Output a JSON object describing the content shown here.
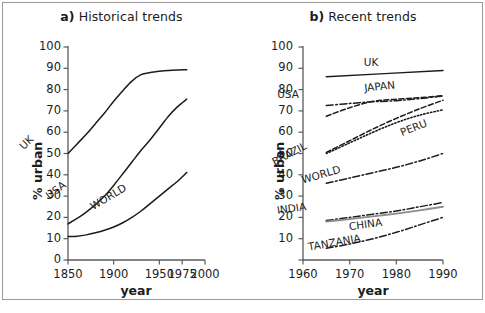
{
  "figure": {
    "width": 485,
    "height": 313,
    "background": "#ffffff",
    "border_color": "#9a9a9a",
    "line_color": "#1c1c1c"
  },
  "panel_a": {
    "title_lead": "a)",
    "title_text": " Historical trends",
    "xlabel": "year",
    "ylabel": "% urban"
  },
  "panel_b": {
    "title_lead": "b)",
    "title_text": " Recent trends",
    "xlabel": "year",
    "ylabel": "% urban"
  },
  "chart_data": [
    {
      "id": "panel_a",
      "type": "line",
      "title": "a) Historical trends",
      "xlabel": "year",
      "ylabel": "% urban",
      "xlim": [
        1850,
        2000
      ],
      "ylim": [
        0,
        100
      ],
      "xticks": [
        1850,
        1900,
        1950,
        1975,
        2000
      ],
      "xtick_labels": [
        "1850",
        "1900",
        "1950",
        "1975",
        "2000"
      ],
      "yticks": [
        0,
        10,
        20,
        30,
        40,
        50,
        60,
        70,
        80,
        90,
        100
      ],
      "ytick_labels": [
        "0",
        "10",
        "20",
        "30",
        "40",
        "50",
        "60",
        "70",
        "80",
        "90",
        "100"
      ],
      "grid": false,
      "legend": "inline-labels",
      "series": [
        {
          "name": "UK",
          "style": "solid",
          "label_rotation": -45,
          "x": [
            1850,
            1860,
            1870,
            1880,
            1890,
            1900,
            1910,
            1920,
            1930,
            1940,
            1950,
            1960,
            1970,
            1980
          ],
          "y": [
            50,
            54.5,
            59,
            64,
            69,
            74.5,
            79.5,
            84,
            87,
            88,
            88.6,
            89,
            89.2,
            89.3
          ]
        },
        {
          "name": "USA",
          "style": "solid",
          "label_rotation": -38,
          "x": [
            1850,
            1860,
            1870,
            1880,
            1890,
            1900,
            1910,
            1920,
            1930,
            1940,
            1950,
            1960,
            1970,
            1980
          ],
          "y": [
            17,
            19.5,
            22.5,
            26,
            30,
            35,
            40.5,
            46,
            51.5,
            56.5,
            62,
            67.5,
            72,
            75.5
          ]
        },
        {
          "name": "WORLD",
          "style": "solid",
          "label_rotation": -32,
          "x": [
            1850,
            1860,
            1870,
            1880,
            1890,
            1900,
            1910,
            1920,
            1930,
            1940,
            1950,
            1960,
            1970,
            1980
          ],
          "y": [
            11,
            11.2,
            11.8,
            12.8,
            14,
            15.5,
            17.5,
            20,
            23,
            26.5,
            30,
            33.5,
            37,
            41
          ]
        }
      ]
    },
    {
      "id": "panel_b",
      "type": "line",
      "title": "b) Recent trends",
      "xlabel": "year",
      "ylabel": "% urban",
      "xlim": [
        1960,
        1990
      ],
      "ylim": [
        0,
        100
      ],
      "xticks": [
        1960,
        1970,
        1980,
        1990
      ],
      "xtick_labels": [
        "1960",
        "1970",
        "1980",
        "1990"
      ],
      "yticks": [
        10,
        20,
        30,
        40,
        50,
        60,
        70,
        80,
        90,
        100
      ],
      "ytick_labels": [
        "10",
        "20",
        "30",
        "40",
        "50",
        "60",
        "70",
        "80",
        "90",
        "100"
      ],
      "grid": false,
      "legend": "inline-labels",
      "series": [
        {
          "name": "UK",
          "style": "solid",
          "label_rotation": 0,
          "x": [
            1965,
            1990
          ],
          "y": [
            86.0,
            89.0
          ]
        },
        {
          "name": "USA",
          "style": "dash-dot",
          "label_rotation": 0,
          "x": [
            1965,
            1970,
            1975,
            1980,
            1985,
            1990
          ],
          "y": [
            72.5,
            73.5,
            74.3,
            74.8,
            75.8,
            77.0
          ]
        },
        {
          "name": "JAPAN",
          "style": "dashed",
          "label_rotation": -6,
          "x": [
            1965,
            1970,
            1975,
            1980,
            1985,
            1990
          ],
          "y": [
            67.5,
            71.5,
            74.5,
            75.5,
            76.2,
            77.2
          ]
        },
        {
          "name": "PERU",
          "style": "dotted",
          "label_rotation": -22,
          "x": [
            1965,
            1970,
            1975,
            1980,
            1985,
            1990
          ],
          "y": [
            50.0,
            55.0,
            60.0,
            64.5,
            68.0,
            70.5
          ]
        },
        {
          "name": "BRAZIL",
          "style": "dashed",
          "label_rotation": -28,
          "x": [
            1965,
            1970,
            1975,
            1980,
            1985,
            1990
          ],
          "y": [
            50.5,
            56.0,
            61.5,
            66.5,
            71.0,
            75.0
          ]
        },
        {
          "name": "WORLD",
          "style": "dash-dot",
          "label_rotation": -16,
          "x": [
            1965,
            1970,
            1975,
            1980,
            1985,
            1990
          ],
          "y": [
            36.0,
            38.5,
            41.0,
            43.5,
            46.5,
            50.0
          ]
        },
        {
          "name": "INDIA",
          "style": "dash-dot",
          "label_rotation": -8,
          "x": [
            1965,
            1970,
            1975,
            1980,
            1985,
            1990
          ],
          "y": [
            18.5,
            20.0,
            21.5,
            23.0,
            25.0,
            27.0
          ]
        },
        {
          "name": "CHINA",
          "style": "solid-gray",
          "label_rotation": -8,
          "x": [
            1965,
            1970,
            1975,
            1980,
            1985,
            1990
          ],
          "y": [
            18.0,
            19.2,
            20.5,
            21.8,
            23.3,
            25.0
          ]
        },
        {
          "name": "TANZANIA",
          "style": "dash-dot",
          "label_rotation": -10,
          "x": [
            1965,
            1970,
            1975,
            1980,
            1985,
            1990
          ],
          "y": [
            5.5,
            7.5,
            10.0,
            13.0,
            16.5,
            20.0
          ]
        }
      ]
    }
  ]
}
